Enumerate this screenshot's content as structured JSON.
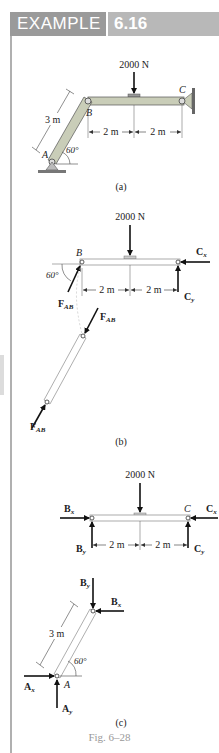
{
  "header": {
    "label": "EXAMPLE",
    "number": "6.16"
  },
  "figure": {
    "caption": "Fig. 6–28",
    "colors": {
      "header_bg": "#9a9a9a",
      "header_num_bg": "#b8b8b8",
      "member_fill": "#c9cdb8",
      "ink": "#222222",
      "caption": "#999999"
    },
    "part_a": {
      "label": "(a)",
      "load": "2000 N",
      "point_a": "A",
      "point_b": "B",
      "point_c": "C",
      "member_length": "3 m",
      "angle": "60°",
      "dim_left": "2 m",
      "dim_right": "2 m"
    },
    "part_b": {
      "label": "(b)",
      "load": "2000 N",
      "point_b": "B",
      "angle": "60°",
      "force_ab": "F",
      "force_ab_sub": "AB",
      "force_cx": "C",
      "force_cx_sub": "x",
      "force_cy": "C",
      "force_cy_sub": "y",
      "dim_left": "2 m",
      "dim_right": "2 m"
    },
    "part_c": {
      "label": "(c)",
      "load": "2000 N",
      "point_a": "A",
      "point_c": "C",
      "member_length": "3 m",
      "angle": "60°",
      "force_bx": "B",
      "force_bx_sub": "x",
      "force_by": "B",
      "force_by_sub": "y",
      "force_cx": "C",
      "force_cx_sub": "x",
      "force_cy": "C",
      "force_cy_sub": "y",
      "force_ax": "A",
      "force_ax_sub": "x",
      "force_ay": "A",
      "force_ay_sub": "y",
      "dim_left": "2 m",
      "dim_right": "2 m"
    }
  }
}
